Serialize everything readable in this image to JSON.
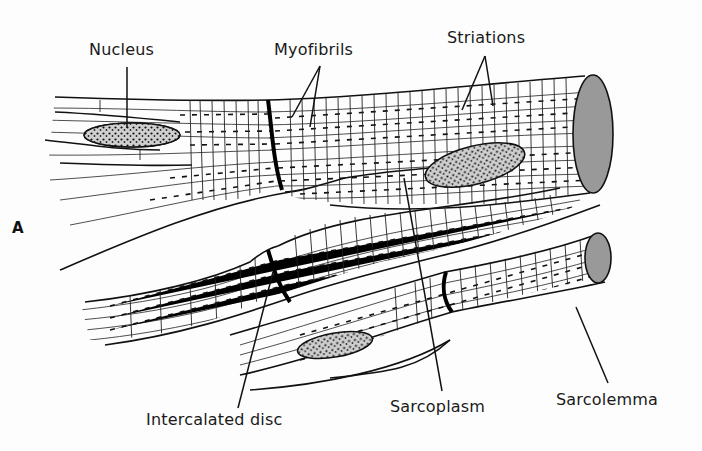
{
  "figure": {
    "panel_label": "A",
    "labels": {
      "nucleus": "Nucleus",
      "myofibrils": "Myofibrils",
      "striations": "Striations",
      "intercalated_disc": "Intercalated disc",
      "sarcoplasm": "Sarcoplasm",
      "sarcolemma": "Sarcolemma"
    },
    "colors": {
      "ink": "#111111",
      "background": "#fdfdfd",
      "stipple": "#777777"
    }
  }
}
